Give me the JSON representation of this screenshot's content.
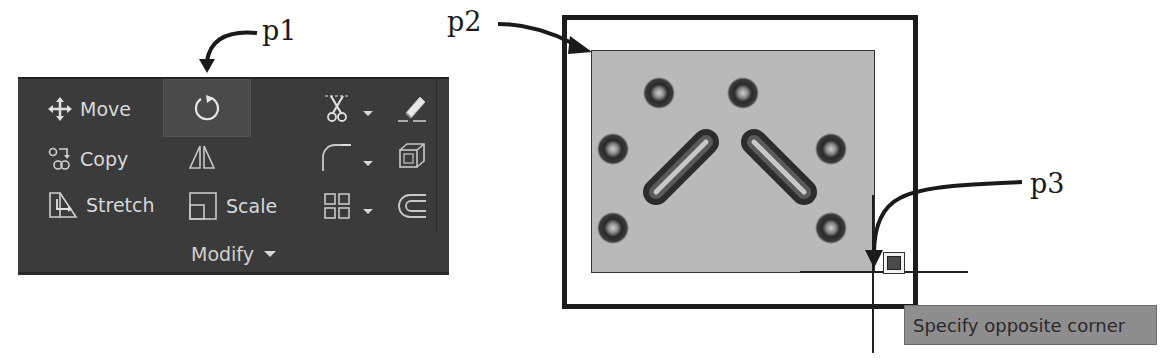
{
  "callouts": {
    "p1": "p1",
    "p2": "p2",
    "p3": "p3"
  },
  "ribbon_panel": {
    "title": "Modify",
    "tools": {
      "move": {
        "label": "Move",
        "icon": "move-icon"
      },
      "copy": {
        "label": "Copy",
        "icon": "copy-icon"
      },
      "stretch": {
        "label": "Stretch",
        "icon": "stretch-icon"
      },
      "rotate": {
        "label": "",
        "icon": "rotate-icon",
        "state": "highlighted"
      },
      "mirror": {
        "label": "",
        "icon": "mirror-icon"
      },
      "scale": {
        "label": "Scale",
        "icon": "scale-icon"
      },
      "trim": {
        "label": "",
        "icon": "scissors-trim-icon",
        "has_dropdown": true
      },
      "fillet": {
        "label": "",
        "icon": "fillet-icon",
        "has_dropdown": true
      },
      "array": {
        "label": "",
        "icon": "array-grid-icon",
        "has_dropdown": true
      },
      "erase": {
        "label": "",
        "icon": "eraser-icon"
      },
      "explode": {
        "label": "",
        "icon": "explode-cube-icon"
      },
      "offset": {
        "label": "",
        "icon": "offset-icon"
      }
    }
  },
  "drawing": {
    "tooltip": "Specify opposite corner"
  },
  "colors": {
    "panel_bg": "#3b3b3c",
    "panel_text": "#d8d8d8",
    "selection_fill": "#b9b9b9",
    "tooltip_bg": "#8e8e8e"
  }
}
